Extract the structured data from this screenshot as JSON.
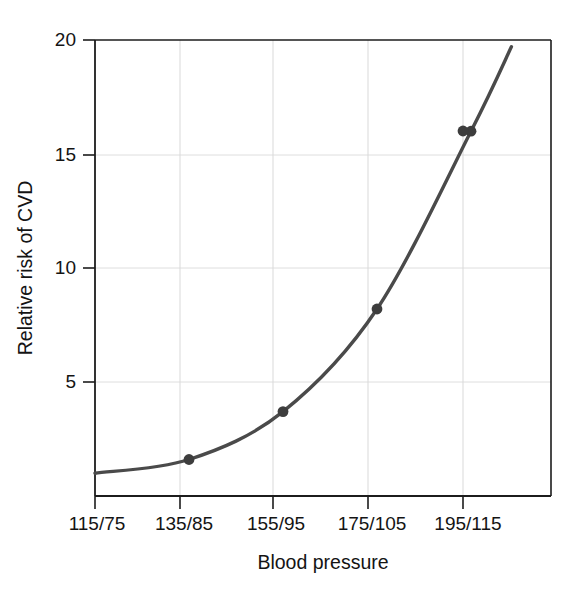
{
  "chart_data": {
    "type": "line",
    "title": "",
    "xlabel": "Blood pressure",
    "ylabel": "Relative risk of CVD",
    "categories": [
      "115/75",
      "135/85",
      "155/95",
      "175/105",
      "195/115"
    ],
    "values": [
      1.0,
      1.6,
      3.7,
      8.2,
      16.0
    ],
    "series": [
      {
        "name": "Relative risk of CVD",
        "values": [
          1.0,
          1.6,
          3.7,
          8.2,
          16.0
        ]
      }
    ],
    "ytick_labels": [
      "5",
      "10",
      "15",
      "20"
    ],
    "ytick_values": [
      5,
      10,
      15,
      20
    ],
    "ylim": [
      0,
      20
    ],
    "xlim_index": [
      0,
      5.4
    ],
    "grid": true,
    "legend": "none",
    "markers": "filled-circle",
    "curve_extends_beyond_last_point_to": 19.7,
    "line_color": "#4a4a4a",
    "marker_color": "#3d3d3d",
    "grid_color": "#d6d6d6",
    "axis_color": "#1c1c1c",
    "background_color": "#ffffff"
  },
  "axes": {
    "x_title": "Blood pressure",
    "y_title": "Relative risk of CVD"
  },
  "ticks": {
    "x": [
      {
        "label": "115/75"
      },
      {
        "label": "135/85"
      },
      {
        "label": "155/95"
      },
      {
        "label": "175/105"
      },
      {
        "label": "195/115"
      }
    ],
    "y": [
      {
        "label": "5"
      },
      {
        "label": "10"
      },
      {
        "label": "15"
      },
      {
        "label": "20"
      }
    ]
  }
}
